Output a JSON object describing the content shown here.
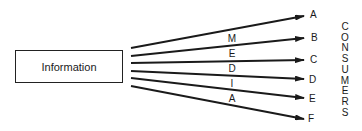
{
  "source": {
    "label": "Information"
  },
  "media": {
    "letters": [
      "M",
      "E",
      "D",
      "I",
      "A"
    ],
    "word": "MEDIA"
  },
  "consumers": {
    "heading": "CONSUMERS",
    "heading_letters": [
      "C",
      "O",
      "N",
      "S",
      "U",
      "M",
      "E",
      "R",
      "S"
    ],
    "items": [
      {
        "label": "A"
      },
      {
        "label": "B"
      },
      {
        "label": "C"
      },
      {
        "label": "D"
      },
      {
        "label": "E"
      },
      {
        "label": "F"
      }
    ]
  },
  "colors": {
    "line": "#1a1a1a",
    "background": "#ffffff"
  }
}
